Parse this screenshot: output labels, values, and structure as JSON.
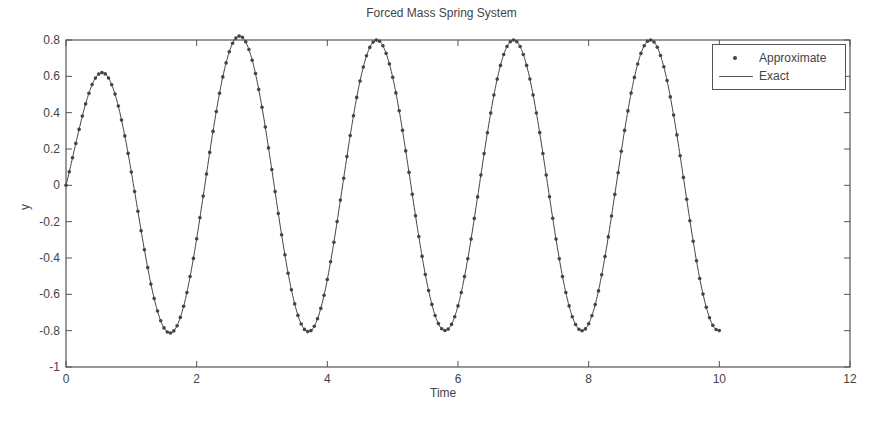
{
  "chart_data": {
    "type": "line",
    "title": "Forced Mass Spring System",
    "xlabel": "Time",
    "ylabel": "y",
    "xlim": [
      0,
      12
    ],
    "ylim": [
      -1,
      0.8
    ],
    "xticks": [
      0,
      2,
      4,
      6,
      8,
      10,
      12
    ],
    "yticks": [
      -1,
      -0.8,
      -0.6,
      -0.4,
      -0.2,
      0,
      0.2,
      0.4,
      0.6,
      0.8
    ],
    "grid": false,
    "legend_position": "upper right",
    "series": [
      {
        "name": "Approximate",
        "style": "dots"
      },
      {
        "name": "Exact",
        "style": "line"
      }
    ],
    "key_points": {
      "peaks": [
        [
          0.63,
          0.56
        ],
        [
          2.66,
          0.79
        ],
        [
          4.76,
          0.79
        ],
        [
          6.86,
          0.79
        ],
        [
          8.96,
          0.79
        ]
      ],
      "troughs": [
        [
          1.64,
          -0.85
        ],
        [
          3.74,
          -0.79
        ],
        [
          5.84,
          -0.79
        ],
        [
          7.94,
          -0.79
        ]
      ],
      "start": [
        0,
        0
      ],
      "end": [
        10,
        -0.78
      ]
    },
    "model": {
      "amplitude": 0.8,
      "omega": 3.0,
      "phase": 0.13,
      "t_start": 0,
      "t_end": 10,
      "step": 0.05
    }
  },
  "labels": {
    "title": "Forced Mass Spring System",
    "xlabel": "Time",
    "ylabel": "y",
    "legend_approx": "Approximate",
    "legend_exact": "Exact"
  },
  "colors": {
    "axis": "#555555",
    "series": "#444444",
    "background": "#ffffff"
  }
}
